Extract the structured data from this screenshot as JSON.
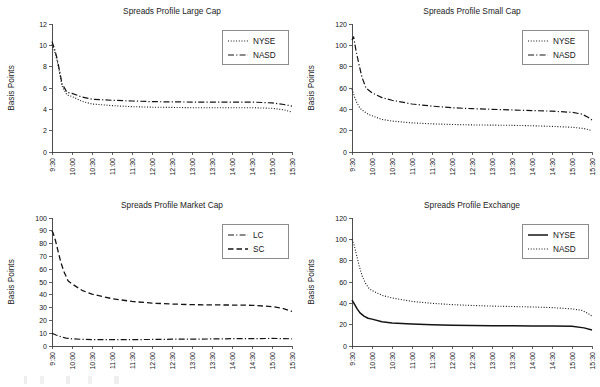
{
  "figure": {
    "background": "#ffffff",
    "ink_color": "#141414",
    "axis_color": "#3b3b3b",
    "panel_count": 4
  },
  "axis": {
    "ylabel": "Basis Points",
    "xlabel": "",
    "x_categories": [
      "9:30",
      "10:00",
      "10:30",
      "11:00",
      "11:30",
      "12:00",
      "12:30",
      "13:00",
      "13:30",
      "14:00",
      "14:30",
      "15:00",
      "15:30"
    ]
  },
  "chart_data": [
    {
      "id": "large-cap",
      "type": "line",
      "title": "Spreads Profile Large Cap",
      "xlabel": "",
      "ylabel": "Basis Points",
      "ylim": [
        0,
        12
      ],
      "yticks": [
        0,
        2,
        4,
        6,
        8,
        10,
        12
      ],
      "grid": false,
      "legend_position": "upper-right",
      "x": [
        "9:30",
        "10:00",
        "10:30",
        "11:00",
        "11:30",
        "12:00",
        "12:30",
        "13:00",
        "13:30",
        "14:00",
        "14:30",
        "15:00",
        "15:30"
      ],
      "series": [
        {
          "name": "NYSE",
          "style": "dotted",
          "values": [
            10.1,
            4.8,
            4.45,
            4.3,
            4.2,
            4.15,
            4.1,
            4.1,
            4.1,
            4.1,
            4.1,
            4.0,
            3.75
          ],
          "dense_x": [
            0.0,
            0.12,
            0.25,
            0.38,
            0.5,
            0.75,
            1.0,
            1.5,
            2.0,
            3.0,
            4.0,
            5.0,
            6.0,
            7.0,
            8.0,
            9.0,
            10.0,
            11.0,
            11.6,
            12.0
          ],
          "dense_y": [
            10.1,
            9.5,
            8.6,
            7.4,
            6.2,
            5.35,
            5.2,
            4.75,
            4.5,
            4.35,
            4.25,
            4.2,
            4.18,
            4.15,
            4.15,
            4.15,
            4.15,
            4.1,
            3.95,
            3.75
          ]
        },
        {
          "name": "NASD",
          "style": "dashdot",
          "values": [
            10.3,
            5.2,
            4.9,
            4.75,
            4.7,
            4.65,
            4.6,
            4.6,
            4.6,
            4.6,
            4.6,
            4.5,
            4.3
          ],
          "dense_x": [
            0.0,
            0.12,
            0.25,
            0.38,
            0.5,
            0.75,
            1.0,
            1.5,
            2.0,
            3.0,
            4.0,
            5.0,
            6.0,
            7.0,
            8.0,
            9.0,
            10.0,
            11.0,
            11.6,
            12.0
          ],
          "dense_y": [
            10.35,
            9.7,
            8.8,
            7.6,
            6.4,
            5.6,
            5.5,
            5.15,
            4.95,
            4.85,
            4.78,
            4.72,
            4.7,
            4.68,
            4.68,
            4.68,
            4.68,
            4.6,
            4.45,
            4.3
          ]
        }
      ]
    },
    {
      "id": "small-cap",
      "type": "line",
      "title": "Spreads Profile Small Cap",
      "xlabel": "",
      "ylabel": "Basis Points",
      "ylim": [
        0,
        120
      ],
      "yticks": [
        0,
        20,
        40,
        60,
        80,
        100,
        120
      ],
      "grid": false,
      "legend_position": "upper-right",
      "x": [
        "9:30",
        "10:00",
        "10:30",
        "11:00",
        "11:30",
        "12:00",
        "12:30",
        "13:00",
        "13:30",
        "14:00",
        "14:30",
        "15:00",
        "15:30"
      ],
      "series": [
        {
          "name": "NYSE",
          "style": "dotted",
          "values": [
            59,
            33,
            29,
            27,
            26,
            25.5,
            25,
            25,
            24.5,
            24,
            23.5,
            23,
            20
          ],
          "dense_x": [
            0.0,
            0.12,
            0.25,
            0.4,
            0.6,
            0.85,
            1.0,
            1.5,
            2.0,
            3.0,
            4.0,
            5.0,
            6.0,
            7.0,
            8.0,
            9.0,
            10.0,
            11.0,
            11.6,
            12.0
          ],
          "dense_y": [
            59,
            52,
            46,
            41,
            38,
            35,
            34,
            30.5,
            29,
            27.3,
            26.4,
            25.8,
            25.4,
            25.2,
            25.0,
            24.6,
            24.0,
            23.2,
            22.0,
            20.0
          ]
        },
        {
          "name": "NASD",
          "style": "dashdot",
          "values": [
            108,
            55,
            48,
            44,
            42,
            41,
            40,
            39.5,
            39,
            38.5,
            38,
            37,
            30
          ],
          "dense_x": [
            0.0,
            0.08,
            0.2,
            0.35,
            0.5,
            0.7,
            0.9,
            1.0,
            1.5,
            2.0,
            3.0,
            4.0,
            5.0,
            6.0,
            7.0,
            8.0,
            9.0,
            10.0,
            11.0,
            11.5,
            11.8,
            12.0
          ],
          "dense_y": [
            105,
            108,
            95,
            82,
            70,
            60,
            57,
            55.5,
            51,
            48.5,
            45,
            43,
            41.5,
            40.6,
            40.0,
            39.4,
            38.8,
            38.3,
            37.2,
            35.5,
            32.5,
            30.0
          ]
        }
      ]
    },
    {
      "id": "market-cap",
      "type": "line",
      "title": "Spreads Profile Market Cap",
      "xlabel": "",
      "ylabel": "Basis Points",
      "ylim": [
        0,
        100
      ],
      "yticks": [
        0,
        10,
        20,
        30,
        40,
        50,
        60,
        70,
        80,
        90,
        100
      ],
      "grid": false,
      "legend_position": "upper-right",
      "x": [
        "9:30",
        "10:00",
        "10:30",
        "11:00",
        "11:30",
        "12:00",
        "12:30",
        "13:00",
        "13:30",
        "14:00",
        "14:30",
        "15:00",
        "15:30"
      ],
      "series": [
        {
          "name": "LC",
          "style": "dashdot",
          "values": [
            10,
            5.5,
            5,
            5,
            5,
            5,
            5.2,
            5.3,
            5.5,
            5.6,
            5.8,
            5.8,
            5.5
          ],
          "dense_x": [
            0.0,
            0.2,
            0.45,
            0.7,
            1.0,
            1.5,
            2.0,
            3.0,
            4.0,
            5.0,
            6.0,
            7.0,
            8.0,
            9.0,
            10.0,
            11.0,
            11.6,
            12.0
          ],
          "dense_y": [
            10.0,
            8.6,
            7.2,
            6.2,
            5.6,
            5.2,
            5.0,
            5.0,
            5.0,
            5.1,
            5.3,
            5.4,
            5.5,
            5.7,
            5.8,
            5.9,
            5.8,
            5.6
          ]
        },
        {
          "name": "SC",
          "style": "dashed",
          "values": [
            90,
            48,
            40,
            36,
            34,
            33,
            32,
            32,
            32,
            32,
            31.5,
            30.5,
            27
          ],
          "dense_x": [
            0.0,
            0.06,
            0.18,
            0.32,
            0.45,
            0.6,
            0.8,
            1.0,
            1.5,
            2.0,
            3.0,
            4.0,
            5.0,
            6.0,
            7.0,
            8.0,
            9.0,
            10.0,
            11.0,
            11.5,
            11.8,
            12.0
          ],
          "dense_y": [
            90,
            88,
            82,
            73,
            65,
            58,
            51,
            48.5,
            43.5,
            40.5,
            37.0,
            34.8,
            33.5,
            32.8,
            32.3,
            32.1,
            32.0,
            31.8,
            30.8,
            29.6,
            28.0,
            27.0
          ]
        }
      ]
    },
    {
      "id": "exchange",
      "type": "line",
      "title": "Spreads Profile Exchange",
      "xlabel": "",
      "ylabel": "Basis Points",
      "ylim": [
        0,
        120
      ],
      "yticks": [
        0,
        20,
        40,
        60,
        80,
        100,
        120
      ],
      "grid": false,
      "legend_position": "upper-right",
      "x": [
        "9:30",
        "10:00",
        "10:30",
        "11:00",
        "11:30",
        "12:00",
        "12:30",
        "13:00",
        "13:30",
        "14:00",
        "14:30",
        "15:00",
        "15:30"
      ],
      "series": [
        {
          "name": "NYSE",
          "style": "solid",
          "values": [
            43,
            24,
            21.5,
            20,
            19.5,
            19,
            18.8,
            18.7,
            18.5,
            18.5,
            18.3,
            18,
            15
          ],
          "dense_x": [
            0.0,
            0.1,
            0.25,
            0.4,
            0.6,
            0.8,
            1.0,
            1.5,
            2.0,
            3.0,
            4.0,
            5.0,
            6.0,
            7.0,
            8.0,
            9.0,
            10.0,
            11.0,
            11.6,
            12.0
          ],
          "dense_y": [
            43,
            40,
            35,
            31,
            28,
            26,
            25.2,
            22.7,
            21.6,
            20.6,
            20.0,
            19.5,
            19.2,
            19.0,
            18.9,
            18.8,
            18.8,
            18.6,
            17.0,
            15.0
          ]
        },
        {
          "name": "NASD",
          "style": "dotted",
          "values": [
            100,
            52,
            45,
            41,
            39.5,
            38.5,
            37.5,
            37,
            36.5,
            36,
            35.5,
            34.5,
            28
          ],
          "dense_x": [
            0.0,
            0.1,
            0.22,
            0.36,
            0.52,
            0.7,
            0.85,
            1.0,
            1.5,
            2.0,
            3.0,
            4.0,
            5.0,
            6.0,
            7.0,
            8.0,
            9.0,
            10.0,
            11.0,
            11.5,
            11.8,
            12.0
          ],
          "dense_y": [
            100,
            95,
            86,
            75,
            65,
            58,
            54,
            52,
            47.5,
            45.0,
            41.8,
            40.0,
            38.8,
            38.0,
            37.4,
            37.0,
            36.6,
            36.0,
            34.8,
            33.4,
            30.5,
            28.0
          ]
        }
      ]
    }
  ],
  "legends": {
    "large_cap": [
      {
        "label": "NYSE",
        "style": "dotted"
      },
      {
        "label": "NASD",
        "style": "dashdot"
      }
    ],
    "small_cap": [
      {
        "label": "NYSE",
        "style": "dotted"
      },
      {
        "label": "NASD",
        "style": "dashdot"
      }
    ],
    "market_cap": [
      {
        "label": "LC",
        "style": "dashdot"
      },
      {
        "label": "SC",
        "style": "dashed"
      }
    ],
    "exchange": [
      {
        "label": "NYSE",
        "style": "solid"
      },
      {
        "label": "NASD",
        "style": "dotted"
      }
    ]
  }
}
